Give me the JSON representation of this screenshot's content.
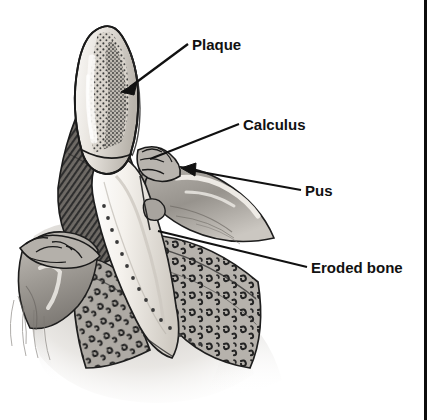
{
  "figure": {
    "type": "medical-illustration",
    "style": "grayscale line drawing with stipple shading",
    "width": 436,
    "height": 420,
    "background_color": "#ffffff"
  },
  "colors": {
    "ink": "#111111",
    "outline": "#1a1a1a",
    "enamel_light": "#f2f0ec",
    "enamel_mid": "#cfcac2",
    "plaque_stipple": "#3a3a3a",
    "root_light": "#f7f5f1",
    "root_shadow": "#d8d3cb",
    "gum_tissue": "#9e9a95",
    "gum_tissue_light": "#c9c5bf",
    "gum_hatch_dark": "#4a4a4a",
    "bone_fill": "#b8b4ae",
    "bone_mark": "#2b2b2b",
    "pus_highlight": "#efece7",
    "border_rule": "#0d0d0d"
  },
  "labels": [
    {
      "id": "plaque",
      "text": "Plaque",
      "text_x": 192,
      "text_y": 50,
      "leader": {
        "x1": 188,
        "y1": 44,
        "x2": 124,
        "y2": 91
      },
      "pointer": "arrow",
      "description": "stippled deposit on the tooth crown surface"
    },
    {
      "id": "calculus",
      "text": "Calculus",
      "text_x": 243,
      "text_y": 130,
      "leader": {
        "x1": 239,
        "y1": 124,
        "x2": 150,
        "y2": 159
      },
      "pointer": "line",
      "description": "hardened deposit at the gum line on the tooth neck"
    },
    {
      "id": "pus",
      "text": "Pus",
      "text_x": 305,
      "text_y": 196,
      "leader": {
        "x1": 301,
        "y1": 190,
        "x2": 182,
        "y2": 168
      },
      "pointer": "arrow",
      "description": "exudate in the periodontal pocket beside the gum"
    },
    {
      "id": "eroded-bone",
      "text": "Eroded bone",
      "text_x": 311,
      "text_y": 273,
      "leader": {
        "x1": 307,
        "y1": 267,
        "x2": 158,
        "y2": 231
      },
      "pointer": "line",
      "description": "trabecular alveolar bone with resorbed crest"
    }
  ],
  "border_rule": {
    "name": "right-vertical-rule",
    "x": 424,
    "y_start": 0,
    "y_end": 420,
    "width": 3
  },
  "anatomy": [
    {
      "id": "crown",
      "name": "tooth-crown",
      "note": "curved hook-shaped crown, light enamel with heavy stippling"
    },
    {
      "id": "root",
      "name": "tooth-root",
      "note": "long tapering pale root descending into socket"
    },
    {
      "id": "gum-left",
      "name": "gingiva-left",
      "note": "gum flap on left with calculus ridge"
    },
    {
      "id": "gum-right",
      "name": "gingiva-right",
      "note": "inflamed gum on right with pus pocket"
    },
    {
      "id": "bone-left",
      "name": "alveolar-bone-left",
      "note": "eroded trabecular bone, comma-shaped marks"
    },
    {
      "id": "bone-right",
      "name": "alveolar-bone-right",
      "note": "eroded trabecular bone, comma-shaped marks"
    },
    {
      "id": "hatch",
      "name": "soft-tissue-hatching",
      "note": "dark cross-hatched tissue behind crown"
    }
  ]
}
